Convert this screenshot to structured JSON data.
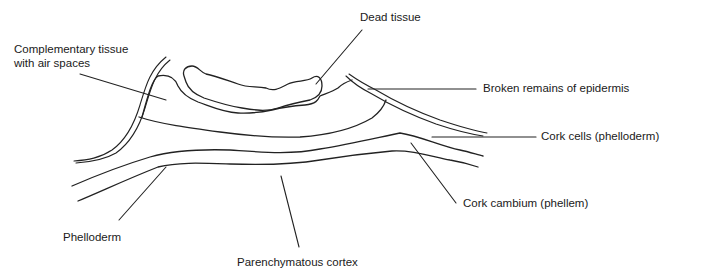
{
  "diagram": {
    "type": "labeled biological cross-section line drawing",
    "line_color": "#222222",
    "background": "#ffffff",
    "labels": {
      "dead_tissue": "Dead tissue",
      "complementary_tissue_line1": "Complementary tissue",
      "complementary_tissue_line2": "with air spaces",
      "broken_epidermis": "Broken remains of epidermis",
      "cork_cells": "Cork cells (phelloderm)",
      "cork_cambium": "Cork cambium (phellem)",
      "phelloderm": "Phelloderm",
      "parenchymatous_cortex": "Parenchymatous cortex"
    }
  }
}
